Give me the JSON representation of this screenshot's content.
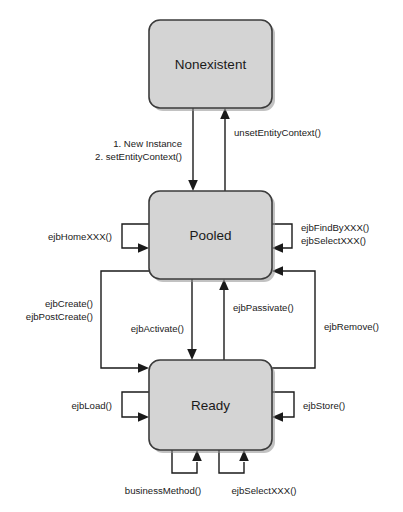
{
  "diagram": {
    "type": "state-machine",
    "colors": {
      "state_fill": "#d4d4d4",
      "state_stroke": "#3b3b3b",
      "line": "#1a1a1a",
      "background": "#ffffff",
      "shadow": "#8f8f8f"
    },
    "states": [
      {
        "id": "nonexistent",
        "label": "Nonexistent",
        "x": 149,
        "y": 20,
        "w": 123,
        "h": 88
      },
      {
        "id": "pooled",
        "label": "Pooled",
        "x": 149,
        "y": 191,
        "w": 123,
        "h": 88
      },
      {
        "id": "ready",
        "label": "Ready",
        "x": 149,
        "y": 360,
        "w": 123,
        "h": 90
      }
    ],
    "transitions": [
      {
        "id": "create-instance",
        "from": "nonexistent",
        "to": "pooled",
        "label_line1": "1. New Instance",
        "label_line2": "2. setEntityContext()"
      },
      {
        "id": "unset-entity-context",
        "from": "pooled",
        "to": "nonexistent",
        "label_line1": "unsetEntityContext()"
      },
      {
        "id": "ejb-home",
        "from": "pooled",
        "to": "pooled",
        "label_line1": "ejbHomeXXX()"
      },
      {
        "id": "ejb-find-select",
        "from": "pooled",
        "to": "pooled",
        "label_line1": "ejbFindByXXX()",
        "label_line2": "ejbSelectXXX()"
      },
      {
        "id": "ejb-create",
        "from": "pooled",
        "to": "ready",
        "label_line1": "ejbCreate()",
        "label_line2": "ejbPostCreate()"
      },
      {
        "id": "ejb-activate",
        "from": "pooled",
        "to": "ready",
        "label_line1": "ejbActivate()"
      },
      {
        "id": "ejb-passivate",
        "from": "ready",
        "to": "pooled",
        "label_line1": "ejbPassivate()"
      },
      {
        "id": "ejb-remove",
        "from": "ready",
        "to": "pooled",
        "label_line1": "ejbRemove()"
      },
      {
        "id": "ejb-load",
        "from": "ready",
        "to": "ready",
        "label_line1": "ejbLoad()"
      },
      {
        "id": "ejb-store",
        "from": "ready",
        "to": "ready",
        "label_line1": "ejbStore()"
      },
      {
        "id": "business-method",
        "from": "ready",
        "to": "ready",
        "label_line1": "businessMethod()"
      },
      {
        "id": "ejb-select",
        "from": "ready",
        "to": "ready",
        "label_line1": "ejbSelectXXX()"
      }
    ]
  }
}
